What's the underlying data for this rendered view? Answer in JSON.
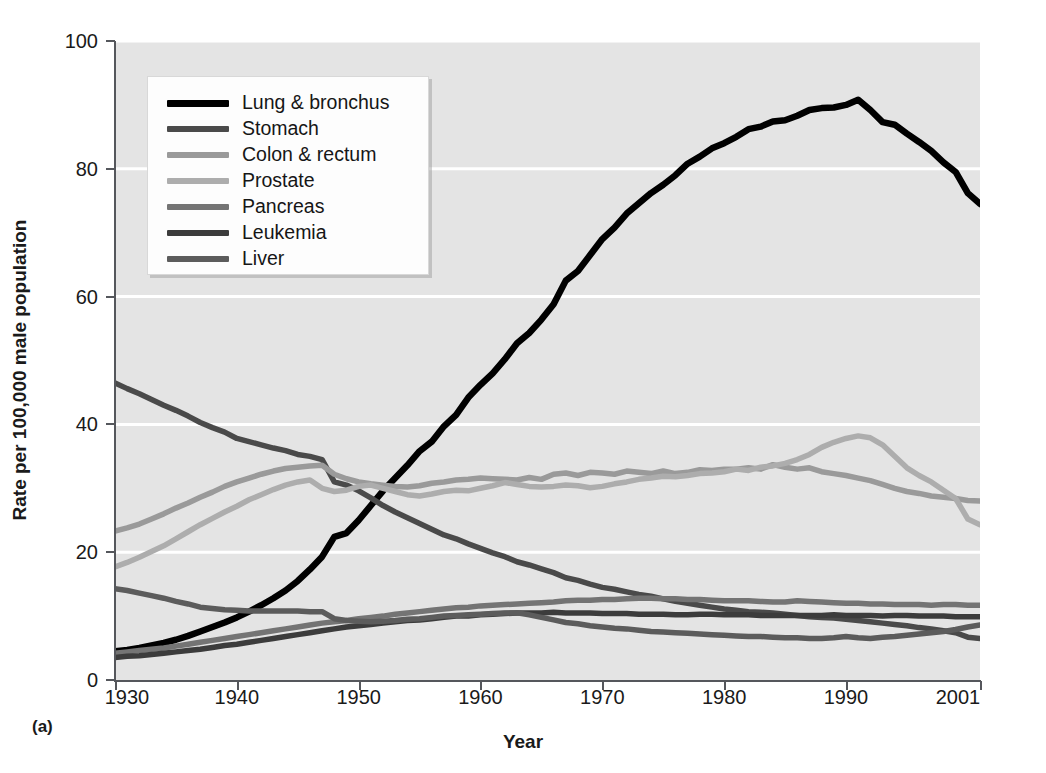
{
  "figure": {
    "panel_label": "(a)",
    "xlabel": "Year",
    "ylabel": "Rate per 100,000 male population",
    "background": "#e4e4e4",
    "gridline_color": "#ffffff",
    "axis_color": "#55575c"
  },
  "axes": {
    "y_ticks": [
      "0",
      "20",
      "40",
      "60",
      "80",
      "100"
    ],
    "x_ticks": [
      "1930",
      "1940",
      "1950",
      "1960",
      "1970",
      "1980",
      "1990",
      "2001"
    ]
  },
  "legend": {
    "entries": [
      {
        "label": "Lung & bronchus",
        "color": "#000000"
      },
      {
        "label": "Stomach",
        "color": "#4a4a4a"
      },
      {
        "label": "Colon & rectum",
        "color": "#9a9a9a"
      },
      {
        "label": "Prostate",
        "color": "#adadad"
      },
      {
        "label": "Pancreas",
        "color": "#747474"
      },
      {
        "label": "Leukemia",
        "color": "#3c3c3c"
      },
      {
        "label": "Liver",
        "color": "#5c5c5c"
      }
    ]
  },
  "chart_data": {
    "type": "line",
    "title": "",
    "xlabel": "Year",
    "ylabel": "Rate per 100,000 male population",
    "xlim": [
      1930,
      2001
    ],
    "ylim": [
      0,
      100
    ],
    "x_tick_values": [
      1930,
      1940,
      1950,
      1960,
      1970,
      1980,
      1990,
      2001
    ],
    "y_tick_values": [
      0,
      20,
      40,
      60,
      80,
      100
    ],
    "grid": "horizontal",
    "legend_position": "upper-left-inside",
    "x": [
      1930,
      1931,
      1932,
      1933,
      1934,
      1935,
      1936,
      1937,
      1938,
      1939,
      1940,
      1941,
      1942,
      1943,
      1944,
      1945,
      1946,
      1947,
      1948,
      1949,
      1950,
      1951,
      1952,
      1953,
      1954,
      1955,
      1956,
      1957,
      1958,
      1959,
      1960,
      1961,
      1962,
      1963,
      1964,
      1965,
      1966,
      1967,
      1968,
      1969,
      1970,
      1971,
      1972,
      1973,
      1974,
      1975,
      1976,
      1977,
      1978,
      1979,
      1980,
      1981,
      1982,
      1983,
      1984,
      1985,
      1986,
      1987,
      1988,
      1989,
      1990,
      1991,
      1992,
      1993,
      1994,
      1995,
      1996,
      1997,
      1998,
      1999,
      2000,
      2001
    ],
    "series": [
      {
        "name": "Lung & bronchus",
        "color": "#000000",
        "values": [
          4.5,
          4.7,
          5.0,
          5.4,
          5.8,
          6.3,
          6.9,
          7.6,
          8.3,
          9.0,
          9.8,
          10.7,
          11.7,
          12.8,
          14.0,
          15.5,
          17.3,
          19.3,
          22.4,
          23.0,
          25.0,
          27.3,
          29.6,
          31.6,
          33.6,
          35.8,
          37.3,
          39.7,
          41.5,
          44.2,
          46.2,
          48.0,
          50.2,
          52.7,
          54.3,
          56.4,
          58.8,
          62.5,
          64.0,
          66.5,
          69.0,
          70.8,
          73.0,
          74.6,
          76.2,
          77.5,
          79.0,
          80.8,
          81.9,
          83.2,
          84.0,
          85.0,
          86.2,
          86.6,
          87.4,
          87.6,
          88.3,
          89.2,
          89.5,
          89.6,
          90.0,
          90.8,
          89.2,
          87.3,
          86.9,
          85.5,
          84.2,
          82.8,
          81.0,
          79.5,
          76.2,
          74.5
        ]
      },
      {
        "name": "Stomach",
        "color": "#4a4a4a",
        "values": [
          46.5,
          45.6,
          44.8,
          43.9,
          43.0,
          42.2,
          41.3,
          40.3,
          39.5,
          38.8,
          37.8,
          37.3,
          36.8,
          36.3,
          35.9,
          35.3,
          35.0,
          34.5,
          31.0,
          30.5,
          29.6,
          28.5,
          27.3,
          26.3,
          25.4,
          24.5,
          23.6,
          22.7,
          22.1,
          21.3,
          20.6,
          19.9,
          19.3,
          18.5,
          18.0,
          17.4,
          16.8,
          16.0,
          15.6,
          15.0,
          14.5,
          14.2,
          13.8,
          13.4,
          13.1,
          12.7,
          12.3,
          12.0,
          11.7,
          11.4,
          11.1,
          10.9,
          10.7,
          10.6,
          10.5,
          10.3,
          10.1,
          9.9,
          9.8,
          9.7,
          9.5,
          9.3,
          9.1,
          8.9,
          8.7,
          8.5,
          8.2,
          8.0,
          7.7,
          7.4,
          6.7,
          6.5
        ]
      },
      {
        "name": "Colon & rectum",
        "color": "#9a9a9a",
        "values": [
          23.3,
          23.8,
          24.4,
          25.2,
          26.0,
          26.9,
          27.7,
          28.6,
          29.4,
          30.3,
          31.0,
          31.6,
          32.2,
          32.7,
          33.1,
          33.3,
          33.5,
          33.6,
          32.2,
          31.5,
          31.0,
          30.7,
          30.5,
          30.3,
          30.2,
          30.4,
          30.8,
          31.0,
          31.3,
          31.4,
          31.6,
          31.5,
          31.4,
          31.3,
          31.7,
          31.4,
          32.2,
          32.4,
          32.0,
          32.5,
          32.4,
          32.2,
          32.7,
          32.5,
          32.3,
          32.7,
          32.3,
          32.5,
          32.9,
          32.8,
          33.0,
          33.0,
          33.2,
          33.0,
          33.7,
          33.3,
          33.0,
          33.2,
          32.6,
          32.3,
          32.0,
          31.6,
          31.2,
          30.6,
          30.0,
          29.5,
          29.2,
          28.8,
          28.6,
          28.4,
          28.1,
          28.0
        ]
      },
      {
        "name": "Prostate",
        "color": "#adadad",
        "values": [
          17.7,
          18.4,
          19.2,
          20.1,
          21.0,
          22.1,
          23.2,
          24.3,
          25.3,
          26.3,
          27.2,
          28.2,
          29.0,
          29.8,
          30.5,
          31.0,
          31.3,
          30.0,
          29.5,
          29.7,
          30.3,
          30.5,
          30.0,
          29.5,
          29.0,
          28.8,
          29.1,
          29.5,
          29.7,
          29.6,
          30.0,
          30.4,
          30.9,
          30.6,
          30.3,
          30.2,
          30.3,
          30.5,
          30.4,
          30.1,
          30.3,
          30.7,
          31.0,
          31.4,
          31.6,
          31.9,
          31.8,
          32.0,
          32.3,
          32.4,
          32.6,
          33.0,
          32.8,
          33.3,
          33.5,
          33.9,
          34.5,
          35.3,
          36.4,
          37.2,
          37.8,
          38.2,
          37.9,
          36.8,
          35.0,
          33.2,
          32.0,
          31.0,
          29.7,
          28.4,
          25.2,
          24.3
        ]
      },
      {
        "name": "Pancreas",
        "color": "#747474",
        "values": [
          4.2,
          4.4,
          4.6,
          4.8,
          5.0,
          5.3,
          5.6,
          5.9,
          6.2,
          6.5,
          6.8,
          7.1,
          7.4,
          7.7,
          8.0,
          8.3,
          8.6,
          8.9,
          9.1,
          9.3,
          9.6,
          9.8,
          10.0,
          10.3,
          10.5,
          10.7,
          10.9,
          11.1,
          11.3,
          11.4,
          11.6,
          11.7,
          11.8,
          11.9,
          12.0,
          12.1,
          12.2,
          12.4,
          12.5,
          12.5,
          12.6,
          12.6,
          12.7,
          12.8,
          12.8,
          12.7,
          12.7,
          12.6,
          12.6,
          12.5,
          12.4,
          12.4,
          12.4,
          12.3,
          12.2,
          12.2,
          12.4,
          12.3,
          12.2,
          12.1,
          12.0,
          12.0,
          11.9,
          11.9,
          11.8,
          11.8,
          11.8,
          11.7,
          11.8,
          11.8,
          11.7,
          11.7
        ]
      },
      {
        "name": "Leukemia",
        "color": "#3c3c3c",
        "values": [
          3.5,
          3.7,
          3.8,
          4.0,
          4.2,
          4.4,
          4.6,
          4.8,
          5.1,
          5.4,
          5.6,
          5.9,
          6.2,
          6.5,
          6.8,
          7.1,
          7.4,
          7.7,
          8.0,
          8.3,
          8.5,
          8.7,
          8.9,
          9.1,
          9.3,
          9.4,
          9.6,
          9.8,
          10.0,
          10.0,
          10.2,
          10.3,
          10.4,
          10.5,
          10.5,
          10.5,
          10.6,
          10.5,
          10.5,
          10.5,
          10.4,
          10.4,
          10.4,
          10.3,
          10.3,
          10.3,
          10.2,
          10.2,
          10.3,
          10.3,
          10.2,
          10.2,
          10.2,
          10.1,
          10.1,
          10.1,
          10.1,
          10.1,
          10.1,
          10.2,
          10.1,
          10.1,
          10.1,
          10.0,
          10.1,
          10.1,
          10.0,
          10.0,
          10.0,
          9.9,
          9.9,
          9.9
        ]
      },
      {
        "name": "Liver",
        "color": "#5c5c5c",
        "values": [
          14.3,
          14.0,
          13.6,
          13.2,
          12.8,
          12.3,
          11.9,
          11.4,
          11.2,
          11.0,
          10.9,
          10.8,
          10.8,
          10.8,
          10.8,
          10.8,
          10.7,
          10.7,
          9.6,
          9.3,
          9.2,
          9.1,
          9.2,
          9.3,
          9.5,
          9.6,
          9.8,
          10.0,
          10.1,
          10.2,
          10.3,
          10.4,
          10.5,
          10.5,
          10.2,
          9.8,
          9.4,
          9.0,
          8.8,
          8.5,
          8.3,
          8.1,
          8.0,
          7.8,
          7.6,
          7.5,
          7.4,
          7.3,
          7.2,
          7.1,
          7.0,
          6.9,
          6.8,
          6.8,
          6.7,
          6.6,
          6.6,
          6.5,
          6.5,
          6.6,
          6.8,
          6.6,
          6.5,
          6.7,
          6.8,
          7.0,
          7.2,
          7.4,
          7.6,
          7.9,
          8.3,
          8.6
        ]
      }
    ]
  }
}
